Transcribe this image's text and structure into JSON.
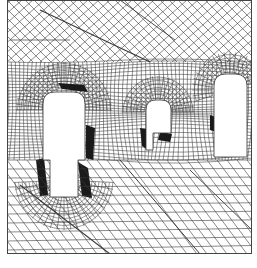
{
  "diagram": {
    "type": "finite-element-mesh",
    "title": "",
    "line_color": "#3a3a3a",
    "dense_color": "#1a1a1a",
    "background": "#ffffff",
    "openings": [
      {
        "name": "left-opening",
        "shape": "stepped-arch"
      },
      {
        "name": "middle-opening",
        "shape": "arch-with-notch"
      },
      {
        "name": "right-opening",
        "shape": "tall-arch"
      }
    ],
    "regions": [
      {
        "name": "upper-skewed-mesh"
      },
      {
        "name": "middle-dense-mesh"
      },
      {
        "name": "lower-skewed-mesh"
      }
    ]
  }
}
